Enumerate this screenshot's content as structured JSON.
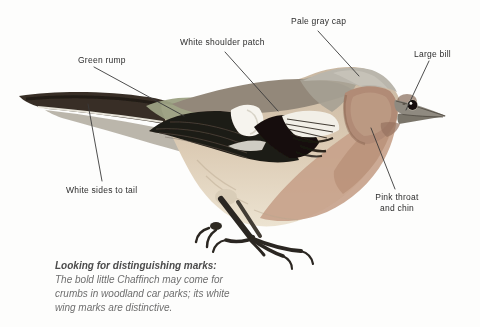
{
  "labels": {
    "pale_gray_cap": "Pale gray cap",
    "white_shoulder_patch": "White shoulder patch",
    "green_rump": "Green rump",
    "large_bill": "Large bill",
    "white_sides_to_tail": "White sides to tail",
    "pink_throat_line1": "Pink throat",
    "pink_throat_line2": "and chin"
  },
  "caption": {
    "heading": "Looking for distinguishing marks:",
    "line1": "The bold little Chaffinch may come for",
    "line2": "crumbs in woodland car parks; its white",
    "line3": "wing marks are distinctive."
  },
  "colors": {
    "background": "#fdfdfc",
    "label_text": "#2d2d2d",
    "leader_line": "#3a3a3a",
    "caption_heading": "#4b4b4b",
    "caption_body": "#6e6e6e",
    "bird_wing_black": "#1f1a14",
    "bird_cap_gray": "#bab6ac",
    "bird_breast_pink": "#c6a189",
    "bird_rump_green": "#9ca183",
    "bird_back_brown": "#93887a",
    "bird_white_patch": "#f6f4ee"
  }
}
